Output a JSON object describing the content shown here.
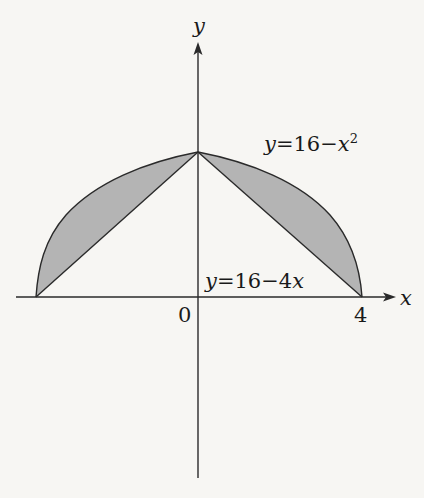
{
  "diagram": {
    "type": "region-between-curves",
    "axes": {
      "x_label": "x",
      "y_label": "y",
      "origin_label": "0",
      "x_tick_label": "4"
    },
    "curves": {
      "upper": {
        "name": "parabola",
        "label_lhs": "y",
        "label_eq": "=",
        "label_rhs": "16−x",
        "label_sup": "2",
        "equation": "y = 16 - x^2"
      },
      "lower": {
        "name": "line",
        "label_lhs": "y",
        "label_eq": "=",
        "label_rhs": "16−4x",
        "equation": "y = 16 - 4x"
      }
    },
    "shaded_regions": 2,
    "colors": {
      "background": "#f7f6f3",
      "stroke": "#2a2a2a",
      "fill": "#b4b4b4"
    }
  }
}
